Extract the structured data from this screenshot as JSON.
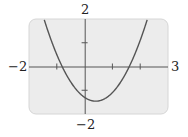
{
  "chart_data": {
    "type": "line",
    "title": "",
    "xlabel": "",
    "ylabel": "",
    "xlim": [
      -2,
      3
    ],
    "ylim": [
      -2,
      2
    ],
    "grid": false,
    "legend": null,
    "axis_labels": {
      "x_min": "−2",
      "x_max": "3",
      "y_max": "2",
      "y_min": "−2"
    },
    "x_ticks": [
      -1,
      1,
      2
    ],
    "y_ticks": [
      -1,
      1
    ],
    "series": [
      {
        "name": "parabola",
        "function": "y = x^2 - 0.8x - 1.3 (approx.)",
        "coefficients": {
          "a": 1.0,
          "b": -0.8,
          "c": -1.3
        },
        "x_intercepts": [
          -0.8,
          1.6
        ],
        "y_intercept": -1.3,
        "vertex": [
          0.4,
          -1.46
        ],
        "color": "#555555"
      }
    ],
    "plot_background": "#ececec",
    "frame_border": "#d6d6d6"
  }
}
